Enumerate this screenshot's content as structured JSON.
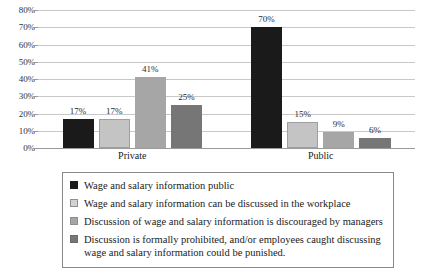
{
  "chart_data": {
    "type": "bar",
    "title": "",
    "xlabel": "",
    "ylabel": "",
    "categories": [
      "Private",
      "Public"
    ],
    "ylim": [
      0,
      80
    ],
    "ytick_labels": [
      "0%",
      "10%",
      "20%",
      "30%",
      "40%",
      "50%",
      "60%",
      "70%",
      "80%"
    ],
    "ytick_values": [
      0,
      10,
      20,
      30,
      40,
      50,
      60,
      70,
      80
    ],
    "grid": true,
    "legend_position": "bottom",
    "value_label_suffix": "%",
    "series": [
      {
        "name": "Wage and salary information public",
        "color": "#1a1a1a",
        "values": [
          17,
          70
        ],
        "labels": [
          "17%",
          "70%"
        ]
      },
      {
        "name": "Wage and salary information can be discussed in the workplace",
        "color": "#c4c4c4",
        "values": [
          17,
          15
        ],
        "labels": [
          "17%",
          "15%"
        ]
      },
      {
        "name": "Discussion of wage and salary information is discouraged by managers",
        "color": "#a6a6a6",
        "values": [
          41,
          9
        ],
        "labels": [
          "41%",
          "9%"
        ]
      },
      {
        "name": "Discussion is formally prohibited, and/or employees caught discussing wage and salary information could be punished.",
        "color": "#767676",
        "values": [
          25,
          6
        ],
        "labels": [
          "25%",
          "6%"
        ]
      }
    ]
  },
  "legend": {
    "items": [
      "Wage and salary information public",
      "Wage and salary information can be discussed in the workplace",
      "Discussion of wage and salary information is discouraged by managers",
      "Discussion is formally prohibited, and/or employees caught discussing\nwage and salary information could be punished."
    ]
  }
}
